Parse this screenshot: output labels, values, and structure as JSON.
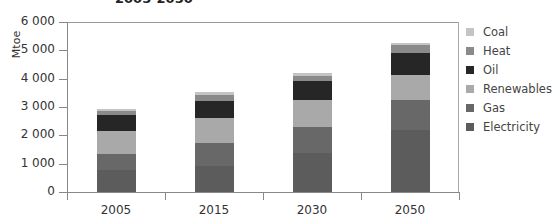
{
  "chart_data": {
    "type": "bar",
    "stacked": true,
    "title": "2005-2050",
    "xlabel": "",
    "ylabel": "Mtoe",
    "ylim": [
      0,
      6000
    ],
    "yticks": [
      "0",
      "1 000",
      "2 000",
      "3 000",
      "4 000",
      "5 000",
      "6 000"
    ],
    "categories": [
      "2005",
      "2015",
      "2030",
      "2050"
    ],
    "legend_position": "right",
    "grid": false,
    "series": [
      {
        "name": "Electricity",
        "color": "#5c5c5c",
        "values": [
          780,
          920,
          1380,
          2190
        ]
      },
      {
        "name": "Gas",
        "color": "#686868",
        "values": [
          560,
          810,
          920,
          1060
        ]
      },
      {
        "name": "Renewables",
        "color": "#a9a9a9",
        "values": [
          810,
          880,
          950,
          880
        ]
      },
      {
        "name": "Oil",
        "color": "#262626",
        "values": [
          560,
          600,
          670,
          780
        ]
      },
      {
        "name": "Heat",
        "color": "#8a8a8a",
        "values": [
          140,
          210,
          180,
          280
        ]
      },
      {
        "name": "Coal",
        "color": "#c4c4c4",
        "values": [
          90,
          110,
          110,
          70
        ]
      }
    ],
    "legend_order": [
      "Coal",
      "Heat",
      "Oil",
      "Renewables",
      "Gas",
      "Electricity"
    ]
  }
}
